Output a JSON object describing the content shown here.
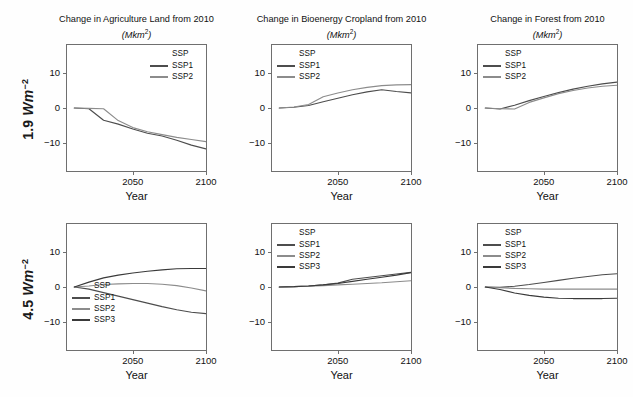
{
  "figure": {
    "background": "#fefefe",
    "row_labels": [
      {
        "value": "1.9",
        "unit_main": "Wm",
        "unit_sup": "−2"
      },
      {
        "value": "4.5",
        "unit_main": "Wm",
        "unit_sup": "−2"
      }
    ],
    "series_colors": {
      "SSP1": "#4d4d4d",
      "SSP2": "#8c8c8c",
      "SSP3": "#3a3a3a"
    },
    "axis_color": "#6f6f6f"
  },
  "chart_data": [
    {
      "id": "agri-1p9",
      "type": "line",
      "title": "Change in Agriculture Land from 2010",
      "units": "(Mkm2)",
      "units_base": "(Mkm",
      "units_sup": "2",
      "units_tail": ")",
      "row": "1.9 Wm-2",
      "xlabel": "Year",
      "ylabel": "",
      "xlim": [
        2005,
        2100
      ],
      "ylim": [
        -18,
        18
      ],
      "xticks": [
        2050,
        2100
      ],
      "xticklabels": [
        "2050",
        "2100"
      ],
      "yticks": [
        -10,
        0,
        10
      ],
      "yticklabels": [
        "−10",
        "0",
        "10"
      ],
      "grid": false,
      "legend": {
        "title": "SSP",
        "position": "top-right",
        "entries": [
          "SSP1",
          "SSP2"
        ]
      },
      "x": [
        2010,
        2020,
        2030,
        2040,
        2050,
        2060,
        2070,
        2080,
        2090,
        2100
      ],
      "series": [
        {
          "name": "SSP1",
          "values": [
            0.0,
            -0.2,
            -3.5,
            -4.6,
            -6.0,
            -7.2,
            -8.0,
            -9.2,
            -10.6,
            -11.7
          ]
        },
        {
          "name": "SSP2",
          "values": [
            0.0,
            -0.1,
            -0.2,
            -3.6,
            -5.6,
            -6.8,
            -7.6,
            -8.4,
            -9.0,
            -9.6
          ]
        }
      ]
    },
    {
      "id": "bioenergy-1p9",
      "type": "line",
      "title": "Change in Bioenergy Cropland from 2010",
      "units": "(Mkm2)",
      "units_base": "(Mkm",
      "units_sup": "2",
      "units_tail": ")",
      "row": "1.9 Wm-2",
      "xlabel": "Year",
      "ylabel": "",
      "xlim": [
        2005,
        2100
      ],
      "ylim": [
        -18,
        18
      ],
      "xticks": [
        2050,
        2100
      ],
      "xticklabels": [
        "2050",
        "2100"
      ],
      "yticks": [
        -10,
        0,
        10
      ],
      "yticklabels": [
        "−10",
        "0",
        "10"
      ],
      "grid": false,
      "legend": {
        "title": "SSP",
        "position": "top-left",
        "entries": [
          "SSP1",
          "SSP2"
        ]
      },
      "x": [
        2010,
        2020,
        2030,
        2040,
        2050,
        2060,
        2070,
        2080,
        2090,
        2100
      ],
      "series": [
        {
          "name": "SSP1",
          "values": [
            0.0,
            0.2,
            0.7,
            1.8,
            2.8,
            3.8,
            4.6,
            5.2,
            4.7,
            4.3
          ]
        },
        {
          "name": "SSP2",
          "values": [
            0.0,
            0.3,
            1.0,
            3.2,
            4.3,
            5.2,
            5.9,
            6.4,
            6.6,
            6.7
          ]
        }
      ]
    },
    {
      "id": "forest-1p9",
      "type": "line",
      "title": "Change in Forest from 2010",
      "units": "(Mkm2)",
      "units_base": "(Mkm",
      "units_sup": "2",
      "units_tail": ")",
      "row": "1.9 Wm-2",
      "xlabel": "Year",
      "ylabel": "",
      "xlim": [
        2005,
        2100
      ],
      "ylim": [
        -18,
        18
      ],
      "xticks": [
        2050,
        2100
      ],
      "xticklabels": [
        "2050",
        "2100"
      ],
      "yticks": [
        -10,
        0,
        10
      ],
      "yticklabels": [
        "−10",
        "0",
        "10"
      ],
      "grid": false,
      "legend": {
        "title": "SSP",
        "position": "top-left",
        "entries": [
          "SSP1",
          "SSP2"
        ]
      },
      "x": [
        2010,
        2020,
        2030,
        2040,
        2050,
        2060,
        2070,
        2080,
        2090,
        2100
      ],
      "series": [
        {
          "name": "SSP1",
          "values": [
            0.0,
            -0.3,
            0.8,
            2.1,
            3.3,
            4.4,
            5.4,
            6.2,
            6.9,
            7.4
          ]
        },
        {
          "name": "SSP2",
          "values": [
            0.0,
            -0.2,
            -0.3,
            1.6,
            2.9,
            4.1,
            5.0,
            5.7,
            6.2,
            6.5
          ]
        }
      ]
    },
    {
      "id": "agri-4p5",
      "type": "line",
      "title": "",
      "units": "",
      "units_base": "",
      "units_sup": "",
      "units_tail": "",
      "row": "4.5 Wm-2",
      "xlabel": "Year",
      "ylabel": "",
      "xlim": [
        2005,
        2100
      ],
      "ylim": [
        -18,
        18
      ],
      "xticks": [
        2050,
        2100
      ],
      "xticklabels": [
        "2050",
        "2100"
      ],
      "yticks": [
        -10,
        0,
        10
      ],
      "yticklabels": [
        "−10",
        "0",
        "10"
      ],
      "grid": false,
      "legend": {
        "title": "SSP",
        "position": "left-mid",
        "entries": [
          "SSP1",
          "SSP2",
          "SSP3"
        ]
      },
      "x": [
        2010,
        2020,
        2030,
        2040,
        2050,
        2060,
        2070,
        2080,
        2090,
        2100
      ],
      "series": [
        {
          "name": "SSP1",
          "values": [
            0.0,
            -0.6,
            -1.6,
            -2.6,
            -3.6,
            -4.6,
            -5.6,
            -6.5,
            -7.2,
            -7.6
          ]
        },
        {
          "name": "SSP2",
          "values": [
            0.0,
            0.3,
            0.7,
            0.9,
            1.0,
            1.0,
            0.8,
            0.4,
            -0.3,
            -1.1
          ]
        },
        {
          "name": "SSP3",
          "values": [
            0.0,
            1.4,
            2.6,
            3.4,
            4.0,
            4.5,
            4.9,
            5.2,
            5.3,
            5.3
          ]
        }
      ]
    },
    {
      "id": "bioenergy-4p5",
      "type": "line",
      "title": "",
      "units": "",
      "units_base": "",
      "units_sup": "",
      "units_tail": "",
      "row": "4.5 Wm-2",
      "xlabel": "Year",
      "ylabel": "",
      "xlim": [
        2005,
        2100
      ],
      "ylim": [
        -18,
        18
      ],
      "xticks": [
        2050,
        2100
      ],
      "xticklabels": [
        "2050",
        "2100"
      ],
      "yticks": [
        -10,
        0,
        10
      ],
      "yticklabels": [
        "−10",
        "0",
        "10"
      ],
      "grid": false,
      "legend": {
        "title": "SSP",
        "position": "top-left",
        "entries": [
          "SSP1",
          "SSP2",
          "SSP3"
        ]
      },
      "x": [
        2010,
        2020,
        2030,
        2040,
        2050,
        2060,
        2070,
        2080,
        2090,
        2100
      ],
      "series": [
        {
          "name": "SSP1",
          "values": [
            0.0,
            0.1,
            0.3,
            0.6,
            1.1,
            2.2,
            2.7,
            3.2,
            3.7,
            4.2
          ]
        },
        {
          "name": "SSP2",
          "values": [
            0.0,
            0.1,
            0.2,
            0.4,
            0.6,
            0.8,
            1.0,
            1.2,
            1.5,
            1.8
          ]
        },
        {
          "name": "SSP3",
          "values": [
            0.0,
            0.1,
            0.3,
            0.6,
            1.0,
            1.6,
            2.2,
            2.8,
            3.4,
            4.1
          ]
        }
      ]
    },
    {
      "id": "forest-4p5",
      "type": "line",
      "title": "",
      "units": "",
      "units_base": "",
      "units_sup": "",
      "units_tail": "",
      "row": "4.5 Wm-2",
      "xlabel": "Year",
      "ylabel": "",
      "xlim": [
        2005,
        2100
      ],
      "ylim": [
        -18,
        18
      ],
      "xticks": [
        2050,
        2100
      ],
      "xticklabels": [
        "2050",
        "2100"
      ],
      "yticks": [
        -10,
        0,
        10
      ],
      "yticklabels": [
        "−10",
        "0",
        "10"
      ],
      "grid": false,
      "legend": {
        "title": "SSP",
        "position": "top-left",
        "entries": [
          "SSP1",
          "SSP2",
          "SSP3"
        ]
      },
      "x": [
        2010,
        2020,
        2030,
        2040,
        2050,
        2060,
        2070,
        2080,
        2090,
        2100
      ],
      "series": [
        {
          "name": "SSP1",
          "values": [
            0.0,
            -0.1,
            0.2,
            0.7,
            1.3,
            1.9,
            2.5,
            3.0,
            3.5,
            3.8
          ]
        },
        {
          "name": "SSP2",
          "values": [
            0.0,
            -0.2,
            -0.4,
            -0.5,
            -0.6,
            -0.6,
            -0.6,
            -0.6,
            -0.6,
            -0.6
          ]
        },
        {
          "name": "SSP3",
          "values": [
            0.0,
            -0.7,
            -1.7,
            -2.4,
            -2.9,
            -3.2,
            -3.3,
            -3.3,
            -3.3,
            -3.2
          ]
        }
      ]
    }
  ]
}
